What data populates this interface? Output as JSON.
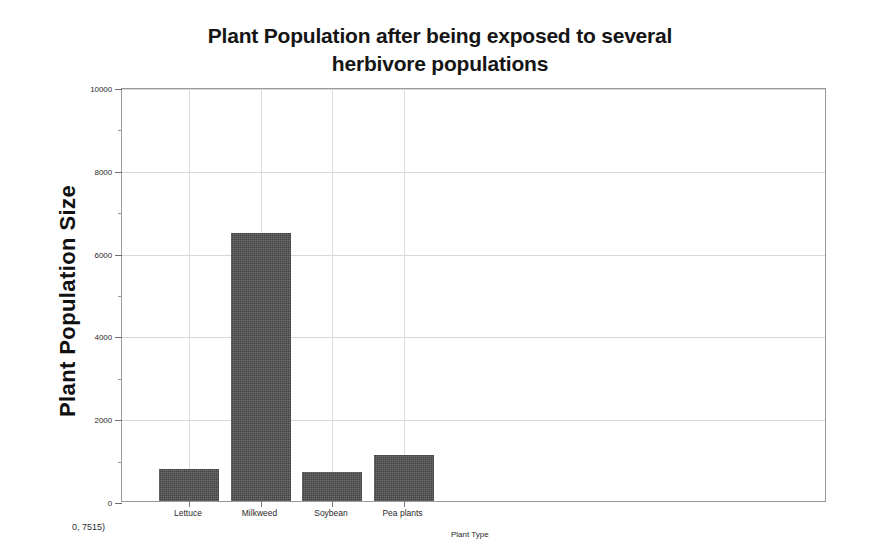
{
  "chart_data": {
    "type": "bar",
    "title": "Plant Population after being exposed to several herbivore populations",
    "title_lines": [
      "Plant Population after being exposed to several",
      "herbivore populations"
    ],
    "xlabel": "Plant Type",
    "ylabel": "Plant Population Size",
    "categories": [
      "Lettuce",
      "Milkweed",
      "Soybean",
      "Pea plants"
    ],
    "values": [
      770,
      6480,
      700,
      1110
    ],
    "ylim": [
      0,
      10000
    ],
    "ytick_labels": [
      "0",
      "2000",
      "4000",
      "6000",
      "8000",
      "10000"
    ],
    "ytick_values": [
      0,
      2000,
      4000,
      6000,
      8000,
      10000
    ],
    "yminor_values": [
      1000,
      3000,
      5000,
      7000,
      9000
    ],
    "grid": true,
    "legend": "none",
    "bar_color": "#434343",
    "grid_color": "#d8d8d8",
    "axis_color": "#9a9a9a",
    "annotation": "0, 7515)",
    "series": [
      {
        "name": "Plant Population Size",
        "values": [
          770,
          6480,
          700,
          1110
        ]
      }
    ]
  }
}
